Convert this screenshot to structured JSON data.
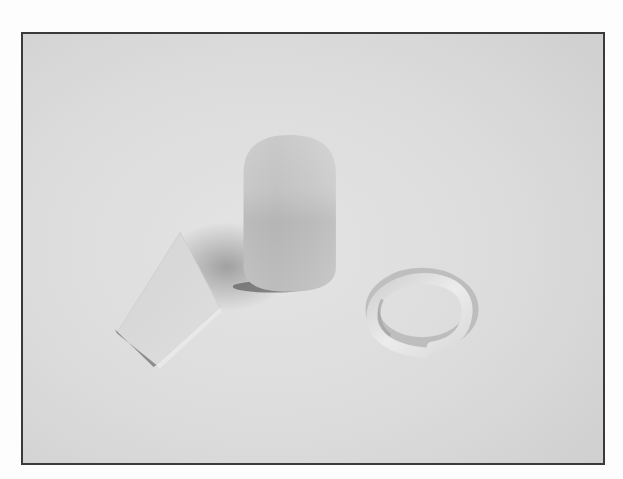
{
  "image": {
    "alt": "Grayscale photograph of three clay shapes on a light surface: a flat square slab, a rounded capsule-shaped cylinder, and a coiled ring",
    "objects": [
      {
        "name": "flat-square-slab",
        "shape": "square slab"
      },
      {
        "name": "capsule-cylinder",
        "shape": "rounded cylinder"
      },
      {
        "name": "coiled-ring",
        "shape": "open ring / coil"
      }
    ],
    "colors": {
      "background": "#dcdcdc",
      "frame": "#3a3a3a",
      "object_light": "#e6e6e6",
      "object_mid": "#b8b8b8",
      "shadow": "#8f8f8f"
    }
  }
}
